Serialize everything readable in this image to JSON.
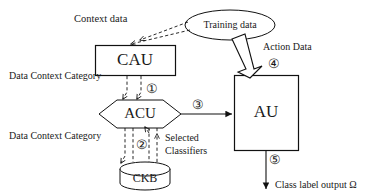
{
  "diagram": {
    "nodes": [
      {
        "id": "cau",
        "label": "CAU",
        "shape": "rectangle"
      },
      {
        "id": "acu",
        "label": "ACU",
        "shape": "hexagon"
      },
      {
        "id": "au",
        "label": "AU",
        "shape": "rectangle"
      },
      {
        "id": "ckb",
        "label": "CKB",
        "shape": "cylinder"
      },
      {
        "id": "training",
        "label": "Training  data",
        "shape": "ellipse"
      }
    ],
    "labels": {
      "context_data": "Context data",
      "training_data": "Training  data",
      "action_data": "Action Data",
      "data_context_category_1": "Data Context Category",
      "data_context_category_2": "Data Context Category",
      "selected_classifiers_line1": "Selected",
      "selected_classifiers_line2": "Classifiers",
      "class_label_output": "Class label output Ω"
    },
    "step_markers": [
      {
        "id": "step-1",
        "symbol": "①"
      },
      {
        "id": "step-2",
        "symbol": "②"
      },
      {
        "id": "step-3",
        "symbol": "③"
      },
      {
        "id": "step-4",
        "symbol": "④"
      },
      {
        "id": "step-5",
        "symbol": "⑤"
      }
    ],
    "colors": {
      "stroke": "#111111",
      "background": "#ffffff",
      "text": "#1a1a1a"
    }
  }
}
